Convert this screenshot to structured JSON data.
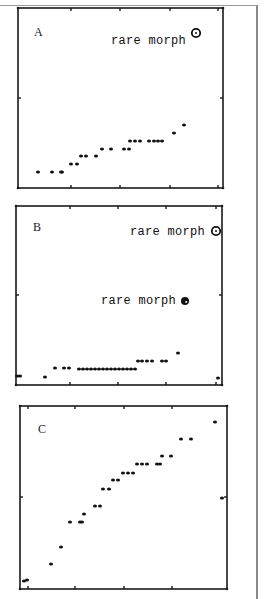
{
  "chart_data": [
    {
      "type": "scatter",
      "panel": "A",
      "title": "A",
      "xlabel": "",
      "ylabel": "",
      "frame_px": {
        "x0": 18,
        "y0": 8,
        "x1": 223,
        "y1": 188
      },
      "x_ticks_px": [
        71,
        120,
        170,
        218
      ],
      "y_ticks_px": [
        98
      ],
      "points_px": [
        [
          38,
          172
        ],
        [
          52,
          172
        ],
        [
          61,
          172
        ],
        [
          62,
          172
        ],
        [
          71,
          164
        ],
        [
          77,
          164
        ],
        [
          81,
          156
        ],
        [
          86,
          156
        ],
        [
          96,
          156
        ],
        [
          102,
          149
        ],
        [
          111,
          149
        ],
        [
          124,
          149
        ],
        [
          129,
          149
        ],
        [
          130,
          141
        ],
        [
          135,
          141
        ],
        [
          140,
          141
        ],
        [
          149,
          141
        ],
        [
          154,
          141
        ],
        [
          158,
          141
        ],
        [
          162,
          141
        ],
        [
          174,
          133
        ],
        [
          184,
          125
        ]
      ],
      "annotations": [
        {
          "text": "rare morph",
          "x": 111,
          "y": 44,
          "marker_x": 196,
          "marker_y": 33,
          "marker": "open-circle"
        }
      ]
    },
    {
      "type": "scatter",
      "panel": "B",
      "title": "B",
      "xlabel": "",
      "ylabel": "",
      "frame_px": {
        "x0": 16,
        "y0": 206,
        "x1": 222,
        "y1": 385
      },
      "x_ticks_px": [
        70,
        118,
        166,
        216
      ],
      "y_ticks_px": [
        295
      ],
      "points_px": [
        [
          17,
          376
        ],
        [
          20,
          376
        ],
        [
          45,
          377
        ],
        [
          55,
          368
        ],
        [
          64,
          368
        ],
        [
          69,
          368
        ],
        [
          79,
          369
        ],
        [
          83,
          369
        ],
        [
          87,
          369
        ],
        [
          91,
          369
        ],
        [
          95,
          369
        ],
        [
          99,
          369
        ],
        [
          103,
          369
        ],
        [
          107,
          369
        ],
        [
          111,
          369
        ],
        [
          115,
          369
        ],
        [
          119,
          369
        ],
        [
          123,
          369
        ],
        [
          127,
          369
        ],
        [
          131,
          369
        ],
        [
          135,
          369
        ],
        [
          138,
          361
        ],
        [
          142,
          361
        ],
        [
          147,
          361
        ],
        [
          152,
          361
        ],
        [
          162,
          361
        ],
        [
          166,
          361
        ],
        [
          178,
          353
        ],
        [
          218,
          378
        ]
      ],
      "annotations": [
        {
          "text": "rare morph",
          "x": 130,
          "y": 235,
          "marker_x": 216,
          "marker_y": 231,
          "marker": "open-circle"
        },
        {
          "text": "rare morph",
          "x": 101,
          "y": 304,
          "marker_x": 185,
          "marker_y": 301,
          "marker": "filled-circle"
        }
      ]
    },
    {
      "type": "scatter",
      "panel": "C",
      "title": "C",
      "xlabel": "",
      "ylabel": "",
      "frame_px": {
        "x0": 20,
        "y0": 406,
        "x1": 227,
        "y1": 589
      },
      "x_ticks_px": [
        28,
        75,
        124,
        172
      ],
      "y_ticks_px": [
        497
      ],
      "points_px": [
        [
          24,
          581
        ],
        [
          27,
          580
        ],
        [
          51,
          564
        ],
        [
          61,
          547
        ],
        [
          70,
          522
        ],
        [
          80,
          522
        ],
        [
          82,
          522
        ],
        [
          84,
          514
        ],
        [
          95,
          506
        ],
        [
          100,
          506
        ],
        [
          103,
          489
        ],
        [
          109,
          489
        ],
        [
          113,
          480
        ],
        [
          118,
          480
        ],
        [
          123,
          473
        ],
        [
          128,
          473
        ],
        [
          133,
          473
        ],
        [
          137,
          464
        ],
        [
          142,
          464
        ],
        [
          147,
          464
        ],
        [
          157,
          464
        ],
        [
          160,
          464
        ],
        [
          162,
          456
        ],
        [
          171,
          456
        ],
        [
          181,
          439
        ],
        [
          191,
          439
        ],
        [
          215,
          422
        ],
        [
          222,
          498
        ]
      ],
      "annotations": []
    }
  ],
  "panels": [
    {
      "label": "A",
      "annotation_1": "rare morph"
    },
    {
      "label": "B",
      "annotation_1": "rare morph",
      "annotation_2": "rare morph"
    },
    {
      "label": "C"
    }
  ]
}
